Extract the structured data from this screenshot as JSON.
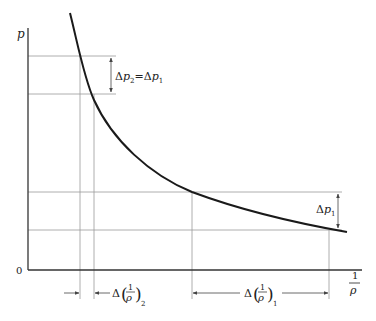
{
  "diagram": {
    "type": "curve-diagram",
    "axes": {
      "y_label": "p",
      "x_label_num": "1",
      "x_label_den": "ρ",
      "origin_label": "0"
    },
    "annotations": {
      "delta_p_top": {
        "lhs_delta": "Δ",
        "lhs_var": "p",
        "lhs_sub": "2",
        "eq": "=",
        "rhs_delta": "Δ",
        "rhs_var": "p",
        "rhs_sub": "1"
      },
      "delta_p_right": {
        "delta": "Δ",
        "var": "p",
        "sub": "1"
      },
      "delta_v2": {
        "delta": "Δ",
        "num": "1",
        "den": "ρ",
        "sub": "2"
      },
      "delta_v1": {
        "delta": "Δ",
        "num": "1",
        "den": "ρ",
        "sub": "1"
      }
    },
    "colors": {
      "curve": "#1a1a1a",
      "axis": "#333333",
      "guide": "#9a9a9a",
      "text": "#222222"
    }
  }
}
